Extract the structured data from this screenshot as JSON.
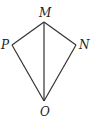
{
  "diagram": {
    "type": "kite",
    "vertices": [
      {
        "label": "M",
        "x": 44,
        "y": 22
      },
      {
        "label": "N",
        "x": 76,
        "y": 45
      },
      {
        "label": "O",
        "x": 44,
        "y": 101
      },
      {
        "label": "P",
        "x": 12,
        "y": 45
      }
    ],
    "segments": [
      [
        "M",
        "N"
      ],
      [
        "N",
        "O"
      ],
      [
        "O",
        "P"
      ],
      [
        "P",
        "M"
      ],
      [
        "M",
        "O"
      ]
    ],
    "labels": {
      "M": "M",
      "N": "N",
      "O": "O",
      "P": "P"
    },
    "stroke_color": "#333333"
  }
}
